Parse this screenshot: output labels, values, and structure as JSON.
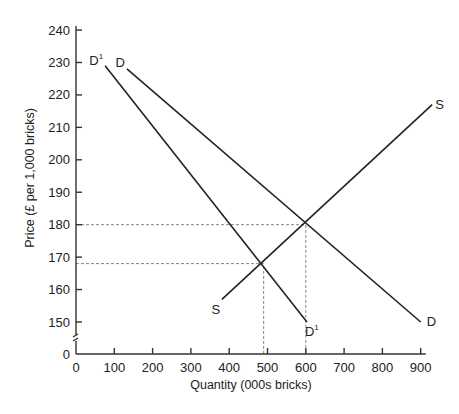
{
  "chart_data": {
    "type": "line",
    "title": "",
    "xlabel": "Quantity  (000s bricks)",
    "ylabel": "Price (£  per 1,000 bricks)",
    "xlim": [
      0,
      900
    ],
    "ylim": [
      150,
      240
    ],
    "y_axis_break": true,
    "y_origin_label": "0",
    "grid": false,
    "legend": "none",
    "x_ticks": [
      0,
      100,
      200,
      300,
      400,
      500,
      600,
      700,
      800,
      900
    ],
    "y_ticks": [
      150,
      160,
      170,
      180,
      190,
      200,
      210,
      220,
      230,
      240
    ],
    "series": [
      {
        "name": "D",
        "start_label": "D",
        "end_label": "D",
        "points": [
          [
            133,
            228
          ],
          [
            900,
            150
          ]
        ]
      },
      {
        "name": "D1",
        "start_label": "D",
        "end_label": "D",
        "superscript": "1",
        "points": [
          [
            76,
            229
          ],
          [
            603,
            150
          ]
        ]
      },
      {
        "name": "S",
        "start_label": "S",
        "end_label": "S",
        "points": [
          [
            381,
            157
          ],
          [
            930,
            217
          ]
        ]
      }
    ],
    "equilibria": [
      {
        "name": "original",
        "curves": [
          "D",
          "S"
        ],
        "quantity": 600,
        "price": 180
      },
      {
        "name": "new",
        "curves": [
          "D1",
          "S"
        ],
        "quantity": 490,
        "price": 168
      }
    ],
    "annotations": [
      "dashed guide lines from equilibrium points to both axes"
    ]
  }
}
